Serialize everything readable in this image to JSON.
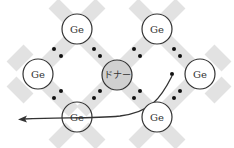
{
  "diagram": {
    "type": "crystal-lattice-donor",
    "atoms": [
      {
        "id": "top-left",
        "label": "Ge",
        "x": 77,
        "y": 29,
        "donor": false
      },
      {
        "id": "top-right",
        "label": "Ge",
        "x": 157,
        "y": 29,
        "donor": false
      },
      {
        "id": "mid-left",
        "label": "Ge",
        "x": 38,
        "y": 74,
        "donor": false
      },
      {
        "id": "mid-right",
        "label": "Ge",
        "x": 200,
        "y": 74,
        "donor": false
      },
      {
        "id": "bottom-left",
        "label": "Ge",
        "x": 77,
        "y": 117,
        "donor": false
      },
      {
        "id": "bottom-right",
        "label": "Ge",
        "x": 157,
        "y": 117,
        "donor": false
      },
      {
        "id": "center",
        "label": "ドナー",
        "x": 117,
        "y": 75,
        "donor": true
      }
    ],
    "colors": {
      "bond": "#e2e2e2",
      "atom_fill": "#ffffff",
      "donor_fill": "#d0d0d0",
      "outline": "#333333",
      "electron": "#111111"
    },
    "free_electron_arrow": {
      "start": [
        172,
        74
      ],
      "end": [
        20,
        119
      ],
      "description": "extra electron leaves donor and moves left"
    }
  },
  "labels": {
    "a0": "Ge",
    "a1": "Ge",
    "a2": "Ge",
    "a3": "Ge",
    "a4": "Ge",
    "a5": "Ge",
    "donor": "ドナー"
  }
}
